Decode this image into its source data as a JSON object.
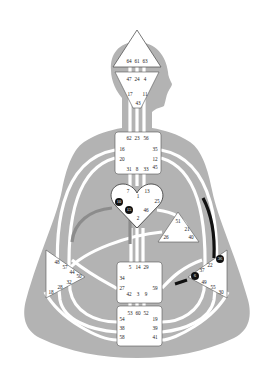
{
  "colors": {
    "background": "#ffffff",
    "body_silhouette": "#b3b3b3",
    "channel_white": "#ffffff",
    "defined_black": "#111111",
    "defined_grey": "#8c8c8c",
    "center_fill": "#ffffff",
    "center_stroke": "#555555"
  },
  "centers": {
    "head": {
      "gates": [
        "64",
        "61",
        "63"
      ]
    },
    "ajna": {
      "gates": [
        "47",
        "24",
        "4",
        "17",
        "11",
        "43"
      ]
    },
    "throat": {
      "gates": [
        "62",
        "23",
        "56",
        "16",
        "35",
        "20",
        "12",
        "45",
        "31",
        "8",
        "33"
      ]
    },
    "g": {
      "gates": [
        "7",
        "1",
        "13",
        "10",
        "25",
        "15",
        "46",
        "2"
      ],
      "active_gates": [
        "10",
        "15"
      ]
    },
    "ego": {
      "gates": [
        "51",
        "21",
        "26",
        "40"
      ]
    },
    "sacral": {
      "gates": [
        "5",
        "14",
        "29",
        "34",
        "27",
        "59",
        "42",
        "3",
        "9"
      ]
    },
    "root": {
      "gates": [
        "53",
        "60",
        "52",
        "54",
        "19",
        "38",
        "39",
        "58",
        "41"
      ]
    },
    "spleen": {
      "gates": [
        "48",
        "57",
        "44",
        "50",
        "32",
        "28",
        "18"
      ]
    },
    "solar_plexus": {
      "gates": [
        "36",
        "22",
        "37",
        "6",
        "49",
        "55",
        "30"
      ],
      "active_gates": [
        "36",
        "6"
      ]
    }
  },
  "defined_channels": [
    {
      "name": "35-36 segment",
      "color": "black"
    },
    {
      "name": "59-6 segment",
      "color": "black"
    },
    {
      "name": "10-57 segment",
      "color": "grey"
    },
    {
      "name": "2-14 segment",
      "color": "grey"
    }
  ]
}
